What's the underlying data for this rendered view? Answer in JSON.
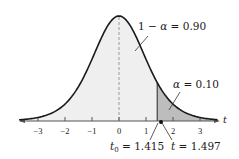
{
  "diagram": {
    "type": "t-distribution",
    "axis_label": "t",
    "ticks": [
      "−3",
      "−2",
      "−1",
      "0",
      "1",
      "2",
      "3"
    ],
    "labels": {
      "center_area": {
        "lhs": "1 − ",
        "sym": "α",
        "rhs": " = 0.90"
      },
      "tail_area": {
        "sym": "α",
        "rhs": " = 0.10"
      },
      "critical": {
        "sym": "t",
        "sub": "0",
        "rhs": " = 1.415"
      },
      "statistic": {
        "sym": "t",
        "rhs": " = 1.497"
      }
    },
    "colors": {
      "curve": "#1a1a1a",
      "center_fill": "#efefef",
      "tail_fill": "#bdbdbd",
      "axis": "#555555",
      "dashed": "#9a9a9a"
    }
  },
  "chart_data": {
    "type": "area",
    "title": "",
    "xlabel": "t",
    "ylabel": "",
    "xlim": [
      -3.6,
      3.6
    ],
    "x_ticks": [
      -3,
      -2,
      -1,
      0,
      1,
      2,
      3
    ],
    "grid": false,
    "regions": [
      {
        "name": "1 − α = 0.90",
        "from": -3.6,
        "to": 1.415,
        "shade": "light"
      },
      {
        "name": "α = 0.10",
        "from": 1.415,
        "to": 3.6,
        "shade": "dark"
      }
    ],
    "annotations": [
      {
        "text": "1 − α = 0.90",
        "target": "center region"
      },
      {
        "text": "α = 0.10",
        "target": "right tail region"
      },
      {
        "text": "t0 = 1.415",
        "x": 1.415,
        "target": "critical value line"
      },
      {
        "text": "t = 1.497",
        "x": 1.497,
        "target": "test statistic point"
      }
    ],
    "critical_value": 1.415,
    "test_statistic": 1.497,
    "alpha": 0.1,
    "confidence": 0.9
  }
}
